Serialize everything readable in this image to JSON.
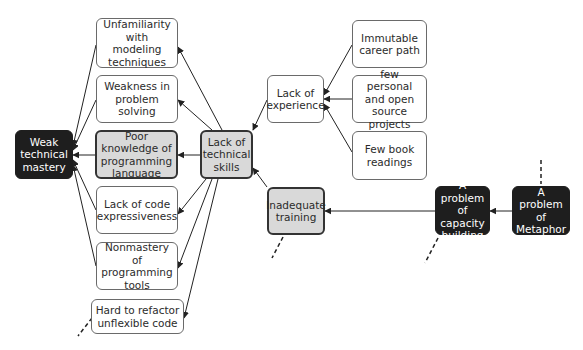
{
  "diagram": {
    "colors": {
      "root_fill": "#1e1e1e",
      "highlight_fill": "#d9d9d9",
      "default_fill": "#ffffff",
      "line": "#222222"
    },
    "nodes": {
      "weak_technical_mastery": "Weak technical mastery",
      "unfamiliarity_modeling": "Unfamiliarity with modeling techniques",
      "weakness_problem_solving": "Weakness in problem solving",
      "poor_knowledge_language": "Poor knowledge of programming language",
      "lack_code_expressiveness": "Lack of code expressiveness",
      "nonmastery_tools": "Nonmastery of programming tools",
      "hard_to_refactor": "Hard to refactor unflexible code",
      "lack_technical_skills": "Lack of technical skills",
      "lack_experience": "Lack of experience",
      "inadequate_training": "Inadequate training",
      "immutable_career": "Immutable career path",
      "few_personal_projects": "few personal and open source projects",
      "few_book_readings": "Few book readings",
      "capacity_building": "A problem of capacity building",
      "metaphor": "A problem of Metaphor"
    },
    "edges": [
      {
        "from": "unfamiliarity_modeling",
        "to": "weak_technical_mastery"
      },
      {
        "from": "weakness_problem_solving",
        "to": "weak_technical_mastery"
      },
      {
        "from": "poor_knowledge_language",
        "to": "weak_technical_mastery"
      },
      {
        "from": "lack_code_expressiveness",
        "to": "weak_technical_mastery"
      },
      {
        "from": "nonmastery_tools",
        "to": "weak_technical_mastery"
      },
      {
        "from": "lack_technical_skills",
        "to": "unfamiliarity_modeling"
      },
      {
        "from": "lack_technical_skills",
        "to": "weakness_problem_solving"
      },
      {
        "from": "lack_technical_skills",
        "to": "poor_knowledge_language"
      },
      {
        "from": "lack_technical_skills",
        "to": "lack_code_expressiveness"
      },
      {
        "from": "lack_technical_skills",
        "to": "nonmastery_tools"
      },
      {
        "from": "lack_technical_skills",
        "to": "hard_to_refactor"
      },
      {
        "from": "lack_experience",
        "to": "lack_technical_skills"
      },
      {
        "from": "inadequate_training",
        "to": "lack_technical_skills"
      },
      {
        "from": "immutable_career",
        "to": "lack_experience"
      },
      {
        "from": "few_personal_projects",
        "to": "lack_experience"
      },
      {
        "from": "few_book_readings",
        "to": "lack_experience"
      },
      {
        "from": "capacity_building",
        "to": "inadequate_training"
      },
      {
        "from": "metaphor",
        "to": "capacity_building"
      }
    ]
  }
}
